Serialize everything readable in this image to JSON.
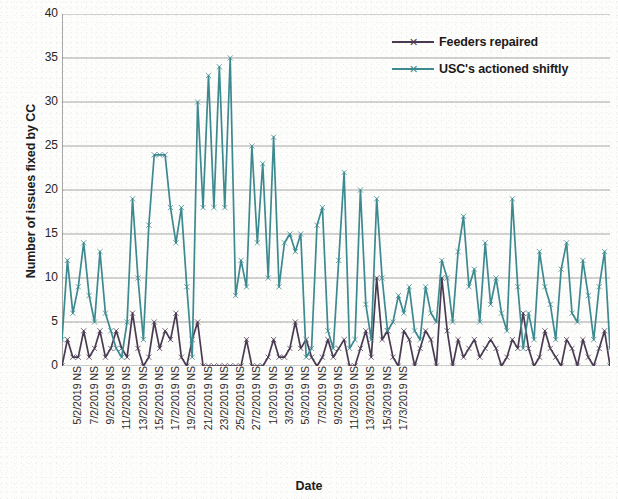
{
  "chart_data": {
    "type": "line",
    "title": "",
    "xlabel": "Date",
    "ylabel": "Number of issues fixed by CC",
    "ylim": [
      0,
      40
    ],
    "yticks": [
      0,
      5,
      10,
      15,
      20,
      25,
      30,
      35,
      40
    ],
    "grid": true,
    "legend_position": "top-right",
    "colors": {
      "feeders_repaired": "#4a3b52",
      "usc_actioned_shiftly": "#3d8a90",
      "gridline": "#8d8d8d",
      "axis": "#6f6f6f",
      "text": "#231f1e",
      "background": "#fdfdfc"
    },
    "x_tick_labels": [
      "5/2/2019 NS",
      "7/2/2019 NS",
      "9/2/2019 NS",
      "11/2/2019 NS",
      "13/2/2019 NS",
      "15/2/2019 NS",
      "17/2/2019 NS",
      "19/2/2019 NS",
      "21/2/2019 NS",
      "23/2/2019 NS",
      "25/2/2019 NS",
      "27/2/2019 NS",
      "1/3/2019 NS",
      "3/3/2019 NS",
      "5/3/2019 NS",
      "7/3/2019 NS",
      "9/3/2019 NS",
      "11/3/2019 NS",
      "13/3/2019 NS",
      "15/3/2019 NS",
      "17/3/2019 NS"
    ],
    "x_points_per_label": 3,
    "series": [
      {
        "name": "Feeders repaired",
        "color": "#4a3b52",
        "marker": "x",
        "values": [
          0,
          3,
          1,
          1,
          4,
          1,
          2,
          4,
          1,
          2,
          4,
          2,
          1,
          6,
          2,
          0,
          1,
          5,
          2,
          4,
          3,
          6,
          1,
          0,
          3,
          5,
          0,
          0,
          0,
          0,
          0,
          0,
          0,
          0,
          3,
          0,
          0,
          0,
          1,
          3,
          1,
          1,
          2,
          5,
          2,
          3,
          1,
          0,
          1,
          3,
          1,
          2,
          3,
          0,
          0,
          2,
          4,
          1,
          10,
          3,
          4,
          1,
          0,
          4,
          3,
          0,
          2,
          4,
          3,
          0,
          10,
          4,
          0,
          3,
          1,
          2,
          3,
          1,
          2,
          3,
          2,
          0,
          1,
          3,
          2,
          6,
          2,
          0,
          1,
          4,
          2,
          1,
          0,
          3,
          2,
          0,
          3,
          1,
          0,
          2,
          4,
          0
        ]
      },
      {
        "name": "USC's actioned shiftly",
        "color": "#3d8a90",
        "marker": "x",
        "values": [
          3,
          12,
          6,
          9,
          14,
          8,
          5,
          13,
          6,
          4,
          2,
          1,
          5,
          19,
          10,
          3,
          16,
          24,
          24,
          24,
          18,
          14,
          18,
          9,
          1,
          30,
          18,
          33,
          18,
          34,
          18,
          35,
          8,
          12,
          9,
          25,
          14,
          23,
          10,
          26,
          9,
          14,
          15,
          13,
          15,
          1,
          2,
          16,
          18,
          4,
          2,
          12,
          22,
          2,
          3,
          20,
          7,
          3,
          19,
          10,
          4,
          5,
          8,
          6,
          9,
          4,
          3,
          9,
          6,
          5,
          12,
          10,
          5,
          13,
          17,
          9,
          11,
          5,
          14,
          7,
          10,
          6,
          4,
          19,
          9,
          2,
          6,
          3,
          13,
          9,
          7,
          3,
          11,
          14,
          6,
          5,
          12,
          8,
          3,
          9,
          13,
          2
        ]
      }
    ]
  },
  "legend": {
    "items": [
      {
        "label": "Feeders repaired"
      },
      {
        "label": "USC's actioned shiftly"
      }
    ]
  },
  "axes": {
    "y_title": "Number of issues fixed by CC",
    "x_title": "Date"
  }
}
